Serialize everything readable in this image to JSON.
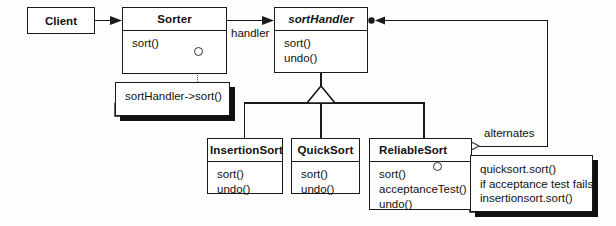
{
  "diagram": {
    "type": "uml-class-diagram",
    "background_color": "#fdfdfb",
    "line_color": "#1a1a1a"
  },
  "classes": [
    {
      "id": "client",
      "name": "Client",
      "abstract": false,
      "operations": []
    },
    {
      "id": "sorter",
      "name": "Sorter",
      "abstract": false,
      "operations": [
        "sort()"
      ]
    },
    {
      "id": "sorthandler",
      "name": "sortHandler",
      "abstract": true,
      "operations": [
        "sort()",
        "undo()"
      ]
    },
    {
      "id": "insertionsort",
      "name": "InsertionSort",
      "abstract": false,
      "operations": [
        "sort()",
        "undo()"
      ]
    },
    {
      "id": "quicksort",
      "name": "QuickSort",
      "abstract": false,
      "operations": [
        "sort()",
        "undo()"
      ]
    },
    {
      "id": "reliablesort",
      "name": "ReliableSort",
      "abstract": false,
      "operations": [
        "sort()",
        "acceptanceTest()",
        "undo()"
      ]
    }
  ],
  "notes": [
    {
      "id": "note-sorter",
      "lines": [
        "sortHandler->sort()"
      ]
    },
    {
      "id": "note-reliablesort",
      "lines": [
        "quicksort.sort()",
        "if acceptance test fails",
        "insertionsort.sort()"
      ]
    }
  ],
  "edge_labels": {
    "handler": "handler",
    "alternates": "alternates"
  },
  "relationships": [
    {
      "from": "client",
      "to": "sorter",
      "kind": "association-arrow"
    },
    {
      "from": "sorter",
      "to": "sorthandler",
      "kind": "association-arrow",
      "label": "handler"
    },
    {
      "from": "insertionsort",
      "to": "sorthandler",
      "kind": "generalization"
    },
    {
      "from": "quicksort",
      "to": "sorthandler",
      "kind": "generalization"
    },
    {
      "from": "reliablesort",
      "to": "sorthandler",
      "kind": "generalization"
    },
    {
      "from": "reliablesort",
      "to": "sorthandler",
      "kind": "aggregation",
      "label": "alternates"
    }
  ]
}
